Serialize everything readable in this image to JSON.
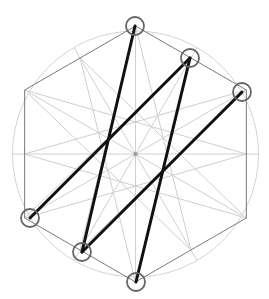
{
  "diagram": {
    "center": [
      135.5,
      154
    ],
    "outer_circle_radius": 123,
    "hexagon_radius": 128,
    "edge_midpoint_radius": 111,
    "colors": {
      "background": "#ffffff",
      "outer_circle": "#d4d4d4",
      "spokes": "#d0d0d0",
      "star_lines": "#cfcfcf",
      "hexagon": "#7a7a7a",
      "markers": "#666666",
      "path": "#111111",
      "center_dot": "#999999"
    },
    "markers": [
      {
        "id": "top-vertex",
        "x": 135,
        "y": 26
      },
      {
        "id": "upper-right-midpoint",
        "x": 190,
        "y": 58
      },
      {
        "id": "right-upper-vertex",
        "x": 242,
        "y": 92
      },
      {
        "id": "left-lower-vertex",
        "x": 30,
        "y": 218
      },
      {
        "id": "lower-left-midpoint",
        "x": 82,
        "y": 252
      },
      {
        "id": "bottom-vertex",
        "x": 136,
        "y": 282
      }
    ],
    "marker_radius": 9,
    "thick_segments": [
      {
        "from": [
          135,
          26
        ],
        "to": [
          82,
          252
        ]
      },
      {
        "from": [
          190,
          58
        ],
        "to": [
          30,
          218
        ]
      },
      {
        "from": [
          190,
          58
        ],
        "to": [
          136,
          282
        ]
      },
      {
        "from": [
          242,
          92
        ],
        "to": [
          82,
          252
        ]
      }
    ]
  }
}
